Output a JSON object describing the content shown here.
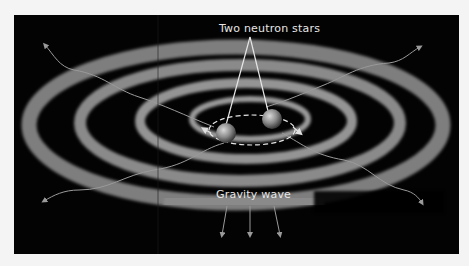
{
  "diagram": {
    "labels": {
      "stars": "Two neutron stars",
      "wave": "Gravity wave"
    },
    "colors": {
      "background": "#030303",
      "page": "#f4f4f4",
      "ring": "#8a8a8a",
      "star": "#9a9a9a",
      "text": "#e6e6e6"
    },
    "elements": {
      "stars_count": 2,
      "orbit": "dashed ellipse with direction arrows",
      "spiral_arms": 4,
      "radiating_wavy_arrows": 4,
      "downward_arrows": 3
    }
  }
}
